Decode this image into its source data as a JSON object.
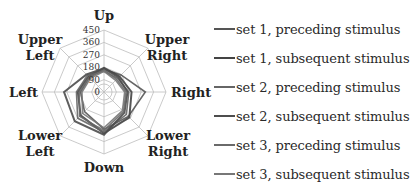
{
  "chart_data": {
    "type": "radar",
    "title": "",
    "categories": [
      "Up",
      "Upper Right",
      "Right",
      "Lower Right",
      "Down",
      "Lower Left",
      "Left",
      "Upper Left"
    ],
    "category_labels": [
      [
        "Up"
      ],
      [
        "Upper",
        "Right"
      ],
      [
        "Right"
      ],
      [
        "Lower",
        "Right"
      ],
      [
        "Down"
      ],
      [
        "Lower",
        "Left"
      ],
      [
        "Left"
      ],
      [
        "Upper",
        "Left"
      ]
    ],
    "radial_ticks": [
      0,
      90,
      180,
      270,
      360,
      450
    ],
    "radial_tick_labels": [
      "0",
      "90",
      "180",
      "270",
      "360",
      "450"
    ],
    "rlim": [
      0,
      450
    ],
    "grid": true,
    "legend_position": "right",
    "series": [
      {
        "name": "set 1, preceding stimulus",
        "color": "#555555",
        "width": 1.6,
        "values": [
          165,
          175,
          300,
          250,
          270,
          200,
          170,
          150
        ]
      },
      {
        "name": "set 1, subsequent stimulus",
        "color": "#444444",
        "width": 2.0,
        "values": [
          175,
          160,
          200,
          260,
          300,
          240,
          190,
          160
        ]
      },
      {
        "name": "set 2, preceding stimulus",
        "color": "#666666",
        "width": 1.6,
        "values": [
          150,
          140,
          180,
          230,
          290,
          270,
          200,
          170
        ]
      },
      {
        "name": "set 2, subsequent stimulus",
        "color": "#4d4d4d",
        "width": 2.0,
        "values": [
          170,
          150,
          170,
          210,
          310,
          300,
          290,
          180
        ]
      },
      {
        "name": "set 3, preceding stimulus",
        "color": "#6a6a6a",
        "width": 1.6,
        "values": [
          160,
          130,
          160,
          200,
          280,
          250,
          180,
          150
        ]
      },
      {
        "name": "set 3, subsequent stimulus",
        "color": "#777777",
        "width": 1.6,
        "values": [
          150,
          120,
          150,
          190,
          260,
          220,
          160,
          140
        ]
      }
    ]
  },
  "legend": {
    "items": [
      {
        "label": "set 1, preceding stimulus",
        "color": "#555555"
      },
      {
        "label": "set 1, subsequent stimulus",
        "color": "#444444"
      },
      {
        "label": "set 2, preceding stimulus",
        "color": "#666666"
      },
      {
        "label": "set 2, subsequent stimulus",
        "color": "#4d4d4d"
      },
      {
        "label": "set 3, preceding stimulus",
        "color": "#6a6a6a"
      },
      {
        "label": "set 3, subsequent stimulus",
        "color": "#777777"
      }
    ]
  }
}
